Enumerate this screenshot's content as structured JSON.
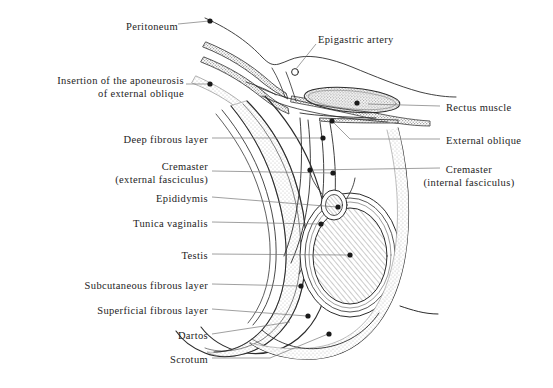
{
  "figure": {
    "type": "anatomical-line-diagram",
    "width": 553,
    "height": 388,
    "background_color": "#ffffff",
    "ink_color": "#2b2b2b",
    "stipple_color": "#9a9a9a",
    "light_stipple_color": "#c9c9c9",
    "hatch_color": "#6e6e6e"
  },
  "labels": {
    "left": [
      {
        "id": "peritoneum",
        "text": "Peritoneum",
        "x": 175,
        "y": 28,
        "leader_to_x": 211,
        "leader_to_y": 21,
        "dot": true
      },
      {
        "id": "insertion-aponeurosis",
        "text": "Insertion of the aponeurosis",
        "x": 152,
        "y": 82,
        "leader_to_x": 209,
        "leader_to_y": 84,
        "dot": true
      },
      {
        "id": "insertion-line2",
        "text": "of external oblique",
        "x": 152,
        "y": 94,
        "leader_to_x": null,
        "leader_to_y": null,
        "dot": false
      },
      {
        "id": "deep-fibrous-layer",
        "text": "Deep fibrous layer",
        "x": 206,
        "y": 141,
        "leader_to_x": 323,
        "leader_to_y": 141,
        "dot": true
      },
      {
        "id": "cremaster-external",
        "text": "Cremaster",
        "x": 206,
        "y": 167,
        "leader_to_x": 333,
        "leader_to_y": 174,
        "dot": true
      },
      {
        "id": "cremaster-external-2",
        "text": "(external fasciculus)",
        "x": 206,
        "y": 180,
        "leader_to_x": null,
        "leader_to_y": null,
        "dot": false
      },
      {
        "id": "epididymis",
        "text": "Epididymis",
        "x": 206,
        "y": 200,
        "leader_to_x": 337,
        "leader_to_y": 208,
        "dot": true
      },
      {
        "id": "tunica-vaginalis",
        "text": "Tunica vaginalis",
        "x": 206,
        "y": 225,
        "leader_to_x": 321,
        "leader_to_y": 225,
        "dot": true
      },
      {
        "id": "testis",
        "text": "Testis",
        "x": 206,
        "y": 257,
        "leader_to_x": 350,
        "leader_to_y": 257,
        "dot": true
      },
      {
        "id": "subcutaneous-fibrous",
        "text": "Subcutaneous fibrous layer",
        "x": 206,
        "y": 287,
        "leader_to_x": 301,
        "leader_to_y": 287,
        "dot": true
      },
      {
        "id": "superficial-fibrous",
        "text": "Superficial fibrous layer",
        "x": 206,
        "y": 312,
        "leader_to_x": 308,
        "leader_to_y": 317,
        "dot": true
      },
      {
        "id": "dartos",
        "text": "Dartos",
        "x": 206,
        "y": 337,
        "leader_to_x": 290,
        "leader_to_y": 322,
        "dot": false
      },
      {
        "id": "scrotum",
        "text": "Scrotum",
        "x": 206,
        "y": 361,
        "leader_to_x": 329,
        "leader_to_y": 333,
        "dot": true
      }
    ],
    "right": [
      {
        "id": "epigastric-artery",
        "text": "Epigastric artery",
        "x": 318,
        "y": 40,
        "leader_to_x": 295,
        "leader_to_y": 72,
        "dot": false
      },
      {
        "id": "rectus-muscle",
        "text": "Rectus muscle",
        "x": 445,
        "y": 109,
        "leader_to_x": 364,
        "leader_to_y": 107,
        "dot": true
      },
      {
        "id": "external-oblique",
        "text": "External oblique",
        "x": 445,
        "y": 142,
        "leader_to_x": 333,
        "leader_to_y": 120,
        "dot": true
      },
      {
        "id": "cremaster-internal",
        "text": "Cremaster",
        "x": 445,
        "y": 171,
        "leader_to_x": 310,
        "leader_to_y": 171,
        "dot": true
      },
      {
        "id": "cremaster-internal-2",
        "text": "(internal fasciculus)",
        "x": 445,
        "y": 184,
        "leader_to_x": null,
        "leader_to_y": null,
        "dot": false
      }
    ]
  },
  "structures": [
    {
      "name": "peritoneum",
      "style": "thin-line"
    },
    {
      "name": "aponeurosis-external-oblique",
      "style": "stippled-band"
    },
    {
      "name": "deep-fibrous-layer",
      "style": "light-stippled-band"
    },
    {
      "name": "cremaster-external-fasciculus",
      "style": "thin-double-line"
    },
    {
      "name": "cremaster-internal-fasciculus",
      "style": "thin-double-line"
    },
    {
      "name": "rectus-muscle",
      "style": "stippled-ellipse"
    },
    {
      "name": "external-oblique",
      "style": "stippled-sliver"
    },
    {
      "name": "testis",
      "style": "hatched-ellipse"
    },
    {
      "name": "epididymis",
      "style": "small-hatched-oval"
    },
    {
      "name": "tunica-vaginalis",
      "style": "double-outline"
    },
    {
      "name": "subcutaneous-fibrous-layer",
      "style": "light-stippled-band"
    },
    {
      "name": "superficial-fibrous-layer",
      "style": "thin-line"
    },
    {
      "name": "dartos",
      "style": "thin-line"
    },
    {
      "name": "scrotum",
      "style": "outer-contour"
    }
  ]
}
